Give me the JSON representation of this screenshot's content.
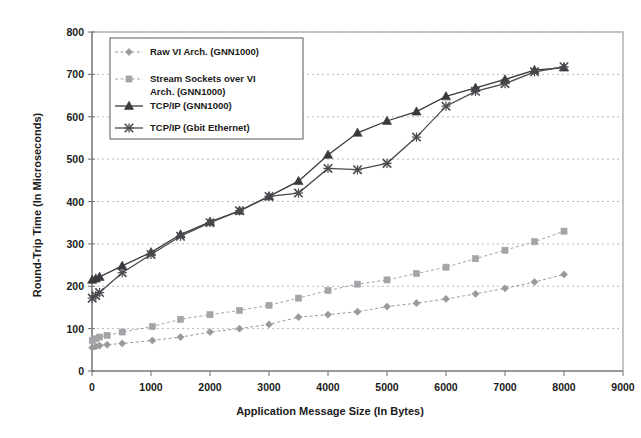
{
  "chart_data": {
    "type": "line",
    "title": "",
    "xlabel": "Application Message Size (In Bytes)",
    "ylabel": "Round-Trip Time (In Microseconds)",
    "xlim": [
      0,
      9000
    ],
    "ylim": [
      0,
      800
    ],
    "xticks": [
      0,
      1000,
      2000,
      3000,
      4000,
      5000,
      6000,
      7000,
      8000,
      9000
    ],
    "yticks": [
      0,
      100,
      200,
      300,
      400,
      500,
      600,
      700,
      800
    ],
    "grid": true,
    "legend_position": "upper-left",
    "series": [
      {
        "name": "Raw VI Arch. (GNN1000)",
        "marker": "diamond",
        "color": "#9a9a9e",
        "x": [
          4,
          64,
          128,
          256,
          512,
          1024,
          1500,
          2000,
          2500,
          3000,
          3500,
          4000,
          4500,
          5000,
          5500,
          6000,
          6500,
          7000,
          7500,
          8000
        ],
        "y": [
          55,
          58,
          60,
          62,
          65,
          72,
          80,
          92,
          100,
          110,
          127,
          133,
          140,
          152,
          160,
          170,
          182,
          195,
          210,
          228
        ]
      },
      {
        "name": "Stream Sockets over VI Arch. (GNN1000)",
        "marker": "square",
        "color": "#a4a4a8",
        "x": [
          4,
          64,
          128,
          256,
          512,
          1024,
          1500,
          2000,
          2500,
          3000,
          3500,
          4000,
          4500,
          5000,
          5500,
          6000,
          6500,
          7000,
          7500,
          8000
        ],
        "y": [
          72,
          76,
          80,
          84,
          92,
          105,
          122,
          133,
          143,
          155,
          172,
          190,
          205,
          215,
          230,
          245,
          265,
          285,
          305,
          330
        ]
      },
      {
        "name": "TCP/IP (GNN1000)",
        "marker": "triangle",
        "color": "#3a3a3e",
        "x": [
          4,
          64,
          128,
          512,
          1000,
          1500,
          2000,
          2500,
          3000,
          3500,
          4000,
          4500,
          5000,
          5500,
          6000,
          6500,
          7000,
          7500,
          8000
        ],
        "y": [
          215,
          218,
          222,
          248,
          280,
          322,
          352,
          378,
          412,
          448,
          510,
          562,
          590,
          612,
          648,
          668,
          688,
          710,
          716
        ]
      },
      {
        "name": "TCP/IP (Gbit Ethernet)",
        "marker": "x",
        "color": "#4a4a4e",
        "x": [
          4,
          64,
          128,
          512,
          1000,
          1500,
          2000,
          2500,
          3000,
          3500,
          4000,
          4500,
          5000,
          5500,
          6000,
          6500,
          7000,
          7500,
          8000
        ],
        "y": [
          172,
          178,
          185,
          232,
          275,
          318,
          350,
          378,
          412,
          420,
          478,
          475,
          490,
          552,
          625,
          660,
          678,
          706,
          718
        ]
      }
    ]
  },
  "legend": {
    "entries": [
      {
        "label": "Raw VI Arch. (GNN1000)",
        "marker": "diamond"
      },
      {
        "label": "Stream Sockets over VI",
        "label2": "Arch. (GNN1000)",
        "marker": "square"
      },
      {
        "label": "TCP/IP (GNN1000)",
        "marker": "triangle"
      },
      {
        "label": "TCP/IP (Gbit Ethernet)",
        "marker": "x"
      }
    ]
  },
  "axes": {
    "y_tick_labels": [
      "800",
      "700",
      "600",
      "500",
      "400",
      "300",
      "200",
      "100",
      "0"
    ],
    "x_tick_labels": [
      "0",
      "1000",
      "2000",
      "3000",
      "4000",
      "5000",
      "6000",
      "7000",
      "8000",
      "9000"
    ]
  },
  "colors": {
    "grid": "#b9b9bd",
    "frame": "#8a8b8f",
    "text": "#1a1a1a"
  }
}
